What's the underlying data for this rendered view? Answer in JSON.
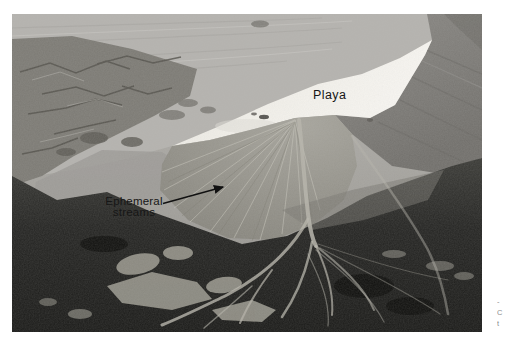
{
  "figure": {
    "labels": {
      "playa": "Playa",
      "ephemeral_streams_line1": "Ephemeral",
      "ephemeral_streams_line2": "streams"
    },
    "colors": {
      "page_background": "#ffffff",
      "playa": "#f2f0ea",
      "bajada_plain": "#b4b2ae",
      "alluvial_fan": "#94928a",
      "mountain_slope": "#807e7a",
      "dark_mountains": "#20201e",
      "label_text": "#161616"
    }
  },
  "margin_caption": {
    "fragments": [
      "-",
      "C",
      "t"
    ]
  }
}
